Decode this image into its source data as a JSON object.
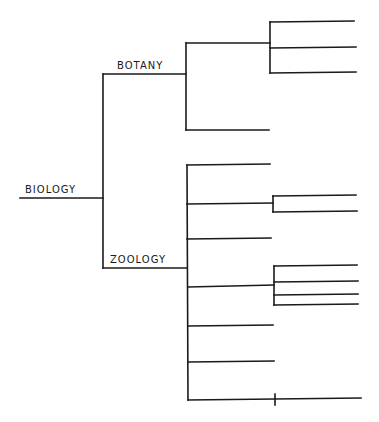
{
  "diagram": {
    "type": "tree",
    "line_color": "#1a1a1a",
    "background": "#ffffff",
    "root": {
      "label": "BIOLOGY",
      "children": [
        {
          "label": "BOTANY",
          "children": [
            {
              "label": "",
              "children": [
                {
                  "label": ""
                },
                {
                  "label": ""
                },
                {
                  "label": ""
                }
              ]
            },
            {
              "label": ""
            }
          ]
        },
        {
          "label": "ZOOLOGY",
          "children": [
            {
              "label": ""
            },
            {
              "label": "",
              "children": [
                {
                  "label": ""
                },
                {
                  "label": ""
                }
              ]
            },
            {
              "label": ""
            },
            {
              "label": "",
              "children": [
                {
                  "label": ""
                },
                {
                  "label": ""
                },
                {
                  "label": ""
                },
                {
                  "label": ""
                }
              ]
            },
            {
              "label": ""
            },
            {
              "label": ""
            },
            {
              "label": "",
              "children": [
                {
                  "label": ""
                }
              ]
            }
          ]
        }
      ]
    }
  },
  "labels": {
    "root": "BIOLOGY",
    "branch_1": "BOTANY",
    "branch_2": "ZOOLOGY"
  }
}
